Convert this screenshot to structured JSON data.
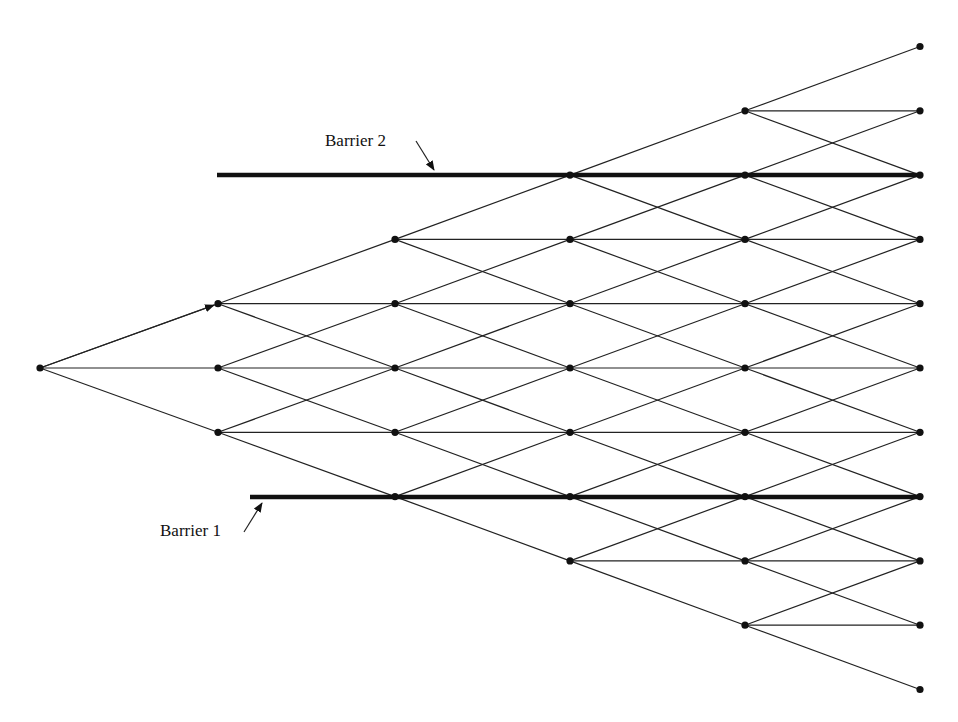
{
  "diagram": {
    "type": "trinomial-tree",
    "levels": 6,
    "layout": {
      "column_x": [
        40,
        218,
        395,
        570,
        745,
        920
      ],
      "center_y": 368,
      "row_spacing": 64.3,
      "node_radius": 3.6
    },
    "colors": {
      "line": "#222222",
      "node": "#111111",
      "barrier": "#111111",
      "background": "#ffffff"
    },
    "barriers": [
      {
        "id": "barrier-2",
        "label": "Barrier 2",
        "y": 175,
        "x_start": 217,
        "x_end": 920,
        "label_x": 325,
        "label_y": 131,
        "arrow_from": [
          416,
          141
        ],
        "arrow_to": [
          434,
          170
        ]
      },
      {
        "id": "barrier-1",
        "label": "Barrier 1",
        "y": 497,
        "x_start": 250,
        "x_end": 920,
        "label_x": 160,
        "label_y": 521,
        "arrow_from": [
          244,
          532
        ],
        "arrow_to": [
          262,
          503
        ]
      }
    ]
  }
}
